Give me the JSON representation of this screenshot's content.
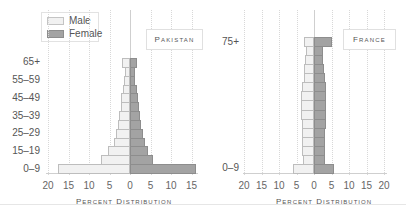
{
  "legend": {
    "items": [
      {
        "label": "Male",
        "color": "#f1f1f1"
      },
      {
        "label": "Female",
        "color": "#a3a3a3"
      }
    ]
  },
  "colors": {
    "male": "#f1f1f1",
    "female": "#a3a3a3"
  },
  "pakistan": {
    "title": "Pakistan",
    "xlabel": "Percent Distribution",
    "ticks": [
      "20",
      "15",
      "10",
      "5",
      "0",
      "5",
      "10",
      "15"
    ],
    "y_tick_labels": [
      "65+",
      "55–59",
      "45–49",
      "35–39",
      "25–29",
      "15–19",
      "0–9"
    ]
  },
  "france": {
    "title": "France",
    "xlabel": "Percent Distribution",
    "ticks": [
      "20",
      "15",
      "10",
      "5",
      "0",
      "5",
      "10",
      "15",
      "20"
    ],
    "y_tick_labels": [
      "75+",
      "0–9"
    ]
  },
  "chart_data": [
    {
      "type": "bar",
      "orientation": "horizontal",
      "subtype": "population-pyramid",
      "title": "Pakistan",
      "xlabel": "Percent Distribution",
      "ylabel": "",
      "xlim": [
        -20,
        16
      ],
      "x_tick_labels": [
        "20",
        "15",
        "10",
        "5",
        "0",
        "5",
        "10",
        "15"
      ],
      "y_tick_labels": [
        "65+",
        "55–59",
        "45–49",
        "35–39",
        "25–29",
        "15–19",
        "0–9"
      ],
      "legend": [
        "Male",
        "Female"
      ],
      "legend_position": "top-left",
      "grid": true,
      "categories": [
        "0–9",
        "10–14",
        "15–19",
        "20–24",
        "25–29",
        "30–34",
        "35–39",
        "40–44",
        "45–49",
        "50–54",
        "55–59",
        "60–64",
        "65+"
      ],
      "series": [
        {
          "name": "Male",
          "values": [
            17.5,
            7.0,
            5.3,
            3.8,
            3.3,
            2.9,
            2.7,
            2.3,
            2.1,
            1.8,
            1.5,
            1.3,
            2.0
          ]
        },
        {
          "name": "Female",
          "values": [
            16.0,
            5.5,
            4.3,
            3.6,
            3.2,
            2.7,
            2.5,
            2.2,
            2.0,
            1.6,
            1.3,
            1.2,
            1.6
          ]
        }
      ]
    },
    {
      "type": "bar",
      "orientation": "horizontal",
      "subtype": "population-pyramid",
      "title": "France",
      "xlabel": "Percent Distribution",
      "ylabel": "",
      "xlim": [
        -20,
        20
      ],
      "x_tick_labels": [
        "20",
        "15",
        "10",
        "5",
        "0",
        "5",
        "10",
        "15",
        "20"
      ],
      "y_tick_labels": [
        "75+",
        "0–9"
      ],
      "legend": [
        "Male",
        "Female"
      ],
      "grid": true,
      "categories": [
        "0–9",
        "10–14",
        "15–19",
        "20–24",
        "25–29",
        "30–34",
        "35–39",
        "40–44",
        "45–49",
        "50–54",
        "55–59",
        "60–64",
        "65–69",
        "70–74",
        "75+"
      ],
      "series": [
        {
          "name": "Male",
          "values": [
            6.0,
            3.2,
            3.3,
            3.3,
            3.4,
            3.4,
            3.6,
            3.6,
            3.6,
            3.3,
            3.0,
            2.8,
            2.5,
            2.2,
            3.0
          ]
        },
        {
          "name": "Female",
          "values": [
            5.7,
            3.0,
            3.1,
            3.1,
            3.2,
            3.3,
            3.4,
            3.5,
            3.5,
            3.3,
            3.1,
            2.9,
            2.7,
            2.6,
            5.2
          ]
        }
      ]
    }
  ]
}
